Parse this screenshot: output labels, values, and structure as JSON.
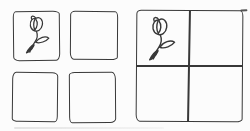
{
  "figure": {
    "background_color": "#fcfcfc",
    "ink_color": "#383838",
    "style": "hand-drawn ink sketch"
  },
  "left_group": {
    "name": "four-separate-squares",
    "cells": [
      {
        "position": "top-left",
        "content": "rose"
      },
      {
        "position": "top-right",
        "content": "empty"
      },
      {
        "position": "bottom-left",
        "content": "empty"
      },
      {
        "position": "bottom-right",
        "content": "empty"
      }
    ]
  },
  "right_group": {
    "name": "single-square-divided-into-four-quadrants",
    "cells": [
      {
        "position": "top-left",
        "content": "rose"
      },
      {
        "position": "top-right",
        "content": "empty"
      },
      {
        "position": "bottom-left",
        "content": "empty"
      },
      {
        "position": "bottom-right",
        "content": "empty"
      }
    ]
  },
  "icons": {
    "rose": "rose-icon"
  }
}
